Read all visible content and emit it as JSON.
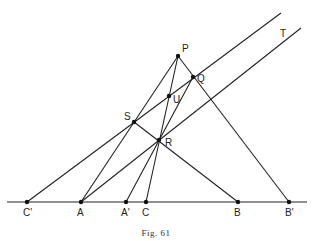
{
  "caption": "Fig. 61",
  "points": {
    "P": {
      "label": "P",
      "x": 178,
      "y": 56,
      "lx": 182,
      "ly": 52
    },
    "Q": {
      "label": "Q",
      "x": 193,
      "y": 77,
      "lx": 197,
      "ly": 82
    },
    "U": {
      "label": "U",
      "x": 169,
      "y": 96,
      "lx": 173,
      "ly": 103
    },
    "S": {
      "label": "S",
      "x": 134,
      "y": 122,
      "lx": 124,
      "ly": 120
    },
    "R": {
      "label": "R",
      "x": 159,
      "y": 140,
      "lx": 165,
      "ly": 146
    },
    "T": {
      "label": "T",
      "x": 283,
      "y": 33,
      "lx": 280,
      "ly": 37
    },
    "Cp": {
      "label": "C'",
      "x": 27,
      "y": 202,
      "lx": 23,
      "ly": 216
    },
    "A": {
      "label": "A",
      "x": 81,
      "y": 202,
      "lx": 77,
      "ly": 216
    },
    "Ap": {
      "label": "A'",
      "x": 126,
      "y": 202,
      "lx": 121,
      "ly": 216
    },
    "C": {
      "label": "C",
      "x": 146,
      "y": 202,
      "lx": 142,
      "ly": 216
    },
    "B": {
      "label": "B",
      "x": 238,
      "y": 202,
      "lx": 234,
      "ly": 216
    },
    "Bp": {
      "label": "B'",
      "x": 289,
      "y": 202,
      "lx": 285,
      "ly": 216
    }
  },
  "lines": [
    {
      "name": "base-line",
      "x1": 7,
      "y1": 202,
      "x2": 307,
      "y2": 202
    },
    {
      "name": "line-Cp-S-U-upper",
      "x1": 27,
      "y1": 202,
      "x2": 281,
      "y2": 13
    },
    {
      "name": "line-A-R-T",
      "x1": 81,
      "y1": 202,
      "x2": 301,
      "y2": 28
    },
    {
      "name": "line-A-S-P",
      "x1": 81,
      "y1": 202,
      "x2": 178,
      "y2": 56
    },
    {
      "name": "line-Ap-R-Q",
      "x1": 126,
      "y1": 202,
      "x2": 193,
      "y2": 77
    },
    {
      "name": "line-C-U-P",
      "x1": 146,
      "y1": 202,
      "x2": 178,
      "y2": 56
    },
    {
      "name": "line-P-Q-Bp",
      "x1": 178,
      "y1": 56,
      "x2": 289,
      "y2": 202
    },
    {
      "name": "line-S-R-B",
      "x1": 134,
      "y1": 122,
      "x2": 238,
      "y2": 202
    }
  ],
  "dots": [
    "P",
    "Q",
    "U",
    "S",
    "R",
    "Cp",
    "A",
    "Ap",
    "C",
    "B",
    "Bp"
  ]
}
